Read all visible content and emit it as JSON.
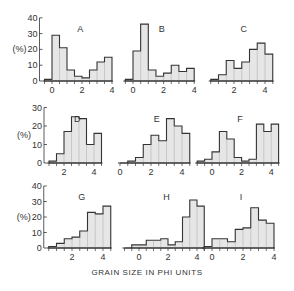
{
  "figure": {
    "xlabel": "GRAIN SIZE IN PHI UNITS",
    "ylabel": "(%)",
    "bar_fill": "#e6e6e6",
    "line_color": "#333333"
  },
  "chart_data": [
    {
      "type": "bar",
      "title": "A",
      "bin_width": 0.5,
      "x_start": -0.5,
      "values": [
        1,
        29,
        21,
        7,
        3,
        2,
        7,
        12,
        15
      ],
      "xticks": [
        "0",
        "2",
        "4"
      ],
      "ylim": [
        0,
        40
      ],
      "yticks": [
        "0",
        "10",
        "20",
        "30",
        "40"
      ],
      "ylabel": "(%)"
    },
    {
      "type": "bar",
      "title": "B",
      "bin_width": 0.5,
      "x_start": -0.5,
      "values": [
        1,
        19,
        36,
        7,
        3,
        5,
        10,
        6,
        8
      ],
      "xticks": [
        "0",
        "2",
        "4"
      ],
      "ylim": [
        0,
        40
      ]
    },
    {
      "type": "bar",
      "title": "C",
      "bin_width": 0.5,
      "x_start": 0.5,
      "values": [
        1,
        4,
        13,
        8,
        12,
        20,
        24,
        17
      ],
      "xticks": [
        "2",
        "4"
      ],
      "ylim": [
        0,
        40
      ]
    },
    {
      "type": "bar",
      "title": "D",
      "bin_width": 0.5,
      "x_start": 1.0,
      "values": [
        1,
        5,
        17,
        25,
        24,
        10,
        16
      ],
      "xticks": [
        "2",
        "4"
      ],
      "ylim": [
        0,
        30
      ],
      "yticks": [
        "0",
        "10",
        "20",
        "30"
      ],
      "ylabel": "(%)"
    },
    {
      "type": "bar",
      "title": "E",
      "bin_width": 0.5,
      "x_start": 0.0,
      "values": [
        0,
        1,
        3,
        10,
        15,
        12,
        24,
        20,
        16
      ],
      "xticks": [
        "0",
        "2",
        "4"
      ],
      "ylim": [
        0,
        30
      ]
    },
    {
      "type": "bar",
      "title": "F",
      "bin_width": 0.5,
      "x_start": -1.0,
      "values": [
        1,
        2,
        6,
        17,
        13,
        3,
        1,
        2,
        21,
        17,
        21
      ],
      "xticks": [
        "0",
        "2",
        "4"
      ],
      "ylim": [
        0,
        30
      ]
    },
    {
      "type": "bar",
      "title": "G",
      "bin_width": 0.5,
      "x_start": 0.5,
      "values": [
        1,
        3,
        6,
        7,
        11,
        23,
        22,
        27
      ],
      "xticks": [
        "2",
        "4"
      ],
      "ylim": [
        0,
        40
      ],
      "yticks": [
        "0",
        "10",
        "20",
        "30",
        "40"
      ],
      "ylabel": "(%)"
    },
    {
      "type": "bar",
      "title": "H",
      "bin_width": 0.5,
      "x_start": -1.0,
      "values": [
        0,
        2,
        2,
        5,
        5,
        6,
        2,
        4,
        20,
        31,
        27
      ],
      "xticks": [
        "0",
        "2",
        "4"
      ],
      "ylim": [
        0,
        40
      ]
    },
    {
      "type": "bar",
      "title": "I",
      "bin_width": 0.5,
      "x_start": -0.5,
      "values": [
        1,
        6,
        6,
        4,
        12,
        13,
        26,
        18,
        16
      ],
      "xticks": [
        "0",
        "2",
        "4"
      ],
      "ylim": [
        0,
        40
      ]
    }
  ]
}
